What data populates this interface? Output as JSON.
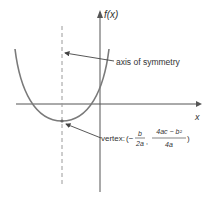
{
  "diagram": {
    "y_axis_label": "f(x)",
    "x_axis_label": "x",
    "annotations": {
      "axis_label": "axis of symmetry",
      "vertex_prefix": "vertex:",
      "vertex_open": "(−",
      "vertex_x_num": "b",
      "vertex_x_den": "2a",
      "vertex_comma": ",",
      "vertex_y_num": "4ac − b²",
      "vertex_y_den": "4a",
      "vertex_close": ")"
    },
    "colors": {
      "curve": "#7a7a7a",
      "axes": "#555555",
      "dashed_line": "#9a9a9a",
      "text": "#333333"
    }
  }
}
